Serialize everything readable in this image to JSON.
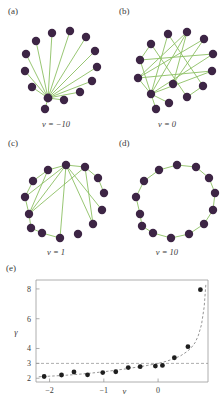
{
  "figure": {
    "panels": [
      {
        "label": "(a)",
        "caption": "ν = −10",
        "type": "star-hub-network"
      },
      {
        "label": "(b)",
        "caption": "ν = 0",
        "type": "random-network"
      },
      {
        "label": "(c)",
        "caption": "ν = 1",
        "type": "partial-ring-network"
      },
      {
        "label": "(d)",
        "caption": "ν = 10",
        "type": "ring-network"
      },
      {
        "label": "(e)",
        "caption": "",
        "type": "scatter-plot"
      }
    ],
    "colors": {
      "node": "#3d2545",
      "edge": "#8cc063",
      "point": "#1e1e1e",
      "axis": "#9a9a9a",
      "dashed": "#8a8a8a"
    }
  },
  "networks": {
    "a": {
      "node_count": 14,
      "nodes": [
        [
          48,
          90
        ],
        [
          32,
          79
        ],
        [
          25,
          63
        ],
        [
          26,
          46
        ],
        [
          36,
          33
        ],
        [
          52,
          25
        ],
        [
          70,
          23
        ],
        [
          86,
          29
        ],
        [
          95,
          43
        ],
        [
          97,
          59
        ],
        [
          92,
          73
        ],
        [
          80,
          84
        ],
        [
          64,
          92
        ],
        [
          45,
          101
        ]
      ],
      "hub_index": 0,
      "edges": [
        [
          0,
          1
        ],
        [
          0,
          2
        ],
        [
          0,
          3
        ],
        [
          0,
          4
        ],
        [
          0,
          5
        ],
        [
          0,
          6
        ],
        [
          0,
          7
        ],
        [
          0,
          8
        ],
        [
          0,
          9
        ],
        [
          0,
          10
        ],
        [
          0,
          11
        ],
        [
          0,
          12
        ],
        [
          0,
          13
        ]
      ]
    },
    "b": {
      "node_count": 14,
      "nodes": [
        [
          40,
          86
        ],
        [
          27,
          70
        ],
        [
          29,
          52
        ],
        [
          40,
          36
        ],
        [
          57,
          26
        ],
        [
          76,
          24
        ],
        [
          93,
          31
        ],
        [
          102,
          46
        ],
        [
          101,
          63
        ],
        [
          92,
          78
        ],
        [
          76,
          89
        ],
        [
          58,
          95
        ],
        [
          45,
          101
        ],
        [
          62,
          76
        ]
      ],
      "edges": [
        [
          0,
          1
        ],
        [
          0,
          4
        ],
        [
          0,
          5
        ],
        [
          0,
          7
        ],
        [
          0,
          8
        ],
        [
          0,
          11
        ],
        [
          0,
          12
        ],
        [
          1,
          5
        ],
        [
          1,
          6
        ],
        [
          1,
          8
        ],
        [
          2,
          3
        ],
        [
          2,
          7
        ],
        [
          3,
          10
        ],
        [
          4,
          9
        ],
        [
          5,
          13
        ],
        [
          9,
          10
        ],
        [
          6,
          13
        ],
        [
          0,
          2
        ]
      ]
    },
    "c": {
      "node_count": 14,
      "nodes": [
        [
          29,
          74
        ],
        [
          25,
          57
        ],
        [
          33,
          41
        ],
        [
          48,
          30
        ],
        [
          66,
          25
        ],
        [
          85,
          27
        ],
        [
          98,
          38
        ],
        [
          104,
          53
        ],
        [
          102,
          70
        ],
        [
          93,
          84
        ],
        [
          78,
          94
        ],
        [
          60,
          98
        ],
        [
          42,
          93
        ],
        [
          31,
          88
        ]
      ],
      "edges": [
        [
          0,
          1
        ],
        [
          1,
          2
        ],
        [
          2,
          3
        ],
        [
          3,
          4
        ],
        [
          4,
          5
        ],
        [
          5,
          6
        ],
        [
          6,
          7
        ],
        [
          0,
          13
        ],
        [
          13,
          12
        ],
        [
          12,
          11
        ],
        [
          0,
          4
        ],
        [
          0,
          5
        ],
        [
          4,
          8
        ],
        [
          4,
          9
        ],
        [
          5,
          9
        ],
        [
          0,
          3
        ],
        [
          1,
          4
        ],
        [
          11,
          4
        ]
      ]
    },
    "d": {
      "node_count": 14,
      "nodes": [
        [
          29,
          74
        ],
        [
          25,
          57
        ],
        [
          33,
          41
        ],
        [
          48,
          30
        ],
        [
          66,
          25
        ],
        [
          85,
          27
        ],
        [
          98,
          38
        ],
        [
          104,
          53
        ],
        [
          102,
          70
        ],
        [
          93,
          84
        ],
        [
          78,
          94
        ],
        [
          60,
          98
        ],
        [
          42,
          93
        ],
        [
          31,
          86
        ]
      ],
      "edges": [
        [
          0,
          1
        ],
        [
          1,
          2
        ],
        [
          2,
          3
        ],
        [
          3,
          4
        ],
        [
          4,
          5
        ],
        [
          5,
          6
        ],
        [
          6,
          7
        ],
        [
          7,
          8
        ],
        [
          8,
          9
        ],
        [
          9,
          10
        ],
        [
          10,
          11
        ],
        [
          11,
          12
        ],
        [
          12,
          13
        ],
        [
          13,
          0
        ]
      ]
    }
  },
  "chart_data": {
    "type": "scatter",
    "title": "",
    "xlabel": "ν",
    "ylabel": "γ",
    "xlim": [
      -2.25,
      0.92
    ],
    "ylim": [
      1.75,
      8.6
    ],
    "xticks": [
      -2,
      -1,
      0,
      1
    ],
    "xticklabels": [
      "−2",
      "−1",
      "0",
      "1"
    ],
    "yticks": [
      2,
      3,
      4,
      6,
      8
    ],
    "yticklabels": [
      "2",
      "3",
      "4",
      "6",
      "8"
    ],
    "grid": false,
    "legend": "none",
    "reference_line": {
      "orientation": "horizontal",
      "y": 3.0,
      "style": "dashed"
    },
    "points": {
      "x": [
        -2.1,
        -1.78,
        -1.55,
        -1.3,
        -1.02,
        -0.78,
        -0.55,
        -0.33,
        -0.05,
        0.08,
        0.3,
        0.55,
        0.78
      ],
      "y": [
        2.12,
        2.22,
        2.42,
        2.23,
        2.38,
        2.44,
        2.72,
        2.78,
        2.82,
        2.86,
        3.38,
        4.12,
        7.95
      ]
    },
    "fit_curve": {
      "style": "dashed",
      "x": [
        -2.2,
        -2.0,
        -1.8,
        -1.6,
        -1.4,
        -1.2,
        -1.0,
        -0.8,
        -0.6,
        -0.4,
        -0.2,
        0.0,
        0.15,
        0.3,
        0.42,
        0.52,
        0.6,
        0.68,
        0.74,
        0.8,
        0.85,
        0.88
      ],
      "y": [
        2.1,
        2.14,
        2.18,
        2.23,
        2.29,
        2.36,
        2.44,
        2.53,
        2.63,
        2.74,
        2.86,
        3.0,
        3.14,
        3.32,
        3.52,
        3.76,
        4.0,
        4.38,
        4.85,
        5.6,
        6.8,
        8.3
      ]
    }
  }
}
